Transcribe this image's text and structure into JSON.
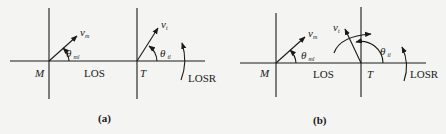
{
  "panels": [
    {
      "id": "a",
      "caption": "(a)",
      "missile_label": "M",
      "target_label": "T",
      "los_label": "LOS",
      "losr_label": "LOSR",
      "missile_velocity": {
        "symbol": "v",
        "subscript": "m"
      },
      "target_velocity": {
        "symbol": "v",
        "subscript": "t"
      },
      "missile_angle": {
        "symbol": "θ",
        "subscript": "ml"
      },
      "target_angle": {
        "symbol": "θ",
        "subscript": "tl"
      }
    },
    {
      "id": "b",
      "caption": "(b)",
      "missile_label": "M",
      "target_label": "T",
      "los_label": "LOS",
      "losr_label": "LOSR",
      "missile_velocity": {
        "symbol": "v",
        "subscript": "m"
      },
      "target_velocity": {
        "symbol": "v",
        "subscript": "t"
      },
      "missile_angle": {
        "symbol": "θ",
        "subscript": "ml"
      },
      "target_angle": {
        "symbol": "θ",
        "subscript": "tl"
      }
    }
  ],
  "colors": {
    "ink": "#1a1a1a",
    "background": "#f4f4f2"
  }
}
